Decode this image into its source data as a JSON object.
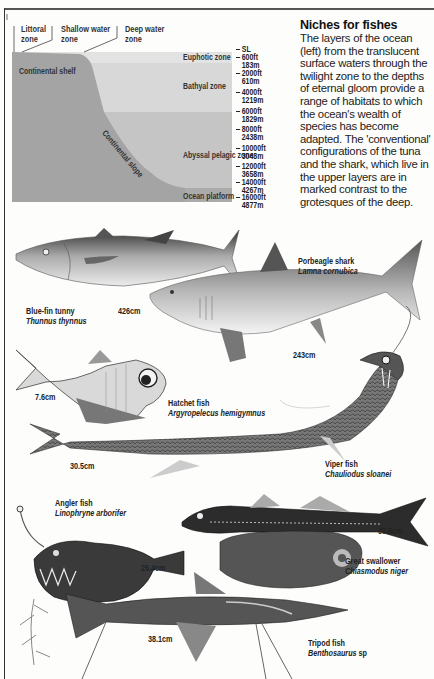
{
  "diagram": {
    "top_labels": [
      {
        "label": "Littoral",
        "sub": "zone"
      },
      {
        "label": "Shallow water",
        "sub": "zone"
      },
      {
        "label": "Deep water",
        "sub": "zone"
      }
    ],
    "zones": [
      {
        "name": "Euphotic zone",
        "color": "#e3e3e3"
      },
      {
        "name": "Bathyal zone",
        "color": "#d6d6d6"
      },
      {
        "name": "Abyssal pelagic zone",
        "color": "#c4c4c4"
      },
      {
        "name": "Ocean platform",
        "color": "#a9a9a9"
      }
    ],
    "continental_shelf": "Continental shelf",
    "continental_slope": "Continental slope",
    "shelf_color": "#a4a4a4",
    "depths": [
      {
        "ft": "SL",
        "m": ""
      },
      {
        "ft": "600ft",
        "m": "183m"
      },
      {
        "ft": "2000ft",
        "m": "610m"
      },
      {
        "ft": "4000ft",
        "m": "1219m"
      },
      {
        "ft": "6000ft",
        "m": "1829m"
      },
      {
        "ft": "8000ft",
        "m": "2438m"
      },
      {
        "ft": "10000ft",
        "m": "3048m"
      },
      {
        "ft": "12000ft",
        "m": "3658m"
      },
      {
        "ft": "14000ft",
        "m": "4267m"
      },
      {
        "ft": "16000ft",
        "m": "4877m"
      }
    ]
  },
  "article": {
    "title": "Niches for fishes",
    "body": "The layers of the ocean (left) from the translucent surface waters through the twilight zone to the depths of eternal gloom provide a range of habitats to which the ocean's wealth of species has become adapted. The 'conventional' configurations of the tuna and the shark, which live in the upper layers are in marked contrast to the grotesques of the deep."
  },
  "fishes": [
    {
      "common": "Blue-fin tunny",
      "latin": "Thunnus thynnus",
      "size": "426cm"
    },
    {
      "common": "Porbeagle shark",
      "latin": "Lamna cornubica",
      "size": "243cm"
    },
    {
      "common": "Hatchet fish",
      "latin": "Argyropelecus hemigymnus",
      "size": "7.6cm"
    },
    {
      "common": "Viper fish",
      "latin": "Chauliodus sloanei",
      "size": "30.5cm"
    },
    {
      "common": "Angler fish",
      "latin": "Linophryne arborifer",
      "size": "25.4cm"
    },
    {
      "common": "Great swallower",
      "latin": "Chiasmodus niger",
      "size": "30.5cm"
    },
    {
      "common": "Tripod fish",
      "latin": "Benthosaurus",
      "latin_suffix": " sp",
      "size": "38.1cm"
    }
  ]
}
